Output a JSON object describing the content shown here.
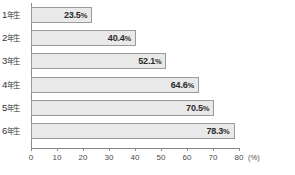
{
  "chart_data": {
    "type": "bar",
    "orientation": "horizontal",
    "title": "",
    "xlabel": "(%)",
    "ylabel": "",
    "xlim": [
      0,
      80
    ],
    "grid": false,
    "legend": null,
    "categories": [
      "1年生",
      "2年生",
      "3年生",
      "4年生",
      "5年生",
      "6年生"
    ],
    "values": [
      23.5,
      40.4,
      52.1,
      64.6,
      70.5,
      78.3
    ],
    "value_labels": [
      "23.5%",
      "40.4%",
      "52.1%",
      "64.6%",
      "70.5%",
      "78.3%"
    ],
    "xticks": [
      0,
      10,
      20,
      30,
      40,
      50,
      60,
      70,
      80
    ],
    "xtick_labels": [
      "0",
      "10",
      "20",
      "30",
      "40",
      "50",
      "60",
      "70",
      "80"
    ],
    "unit_label": "(%)",
    "bar_fill_color": "#e9e9e9",
    "bar_border_color": "#9a9a9a",
    "axis_color": "#8c8c8c",
    "text_color": "#333333"
  },
  "rows": [
    {
      "label": "1年生",
      "num": "1",
      "suffix": "年生",
      "value": 23.5,
      "value_label": "23.5",
      "pct": "%"
    },
    {
      "label": "2年生",
      "num": "2",
      "suffix": "年生",
      "value": 40.4,
      "value_label": "40.4",
      "pct": "%"
    },
    {
      "label": "3年生",
      "num": "3",
      "suffix": "年生",
      "value": 52.1,
      "value_label": "52.1",
      "pct": "%"
    },
    {
      "label": "4年生",
      "num": "4",
      "suffix": "年生",
      "value": 64.6,
      "value_label": "64.6",
      "pct": "%"
    },
    {
      "label": "5年生",
      "num": "5",
      "suffix": "年生",
      "value": 70.5,
      "value_label": "70.5",
      "pct": "%"
    },
    {
      "label": "6年生",
      "num": "6",
      "suffix": "年生",
      "value": 78.3,
      "value_label": "78.3",
      "pct": "%"
    }
  ],
  "axis": {
    "ticks": [
      "0",
      "10",
      "20",
      "30",
      "40",
      "50",
      "60",
      "70",
      "80"
    ],
    "unit": "(%)"
  }
}
